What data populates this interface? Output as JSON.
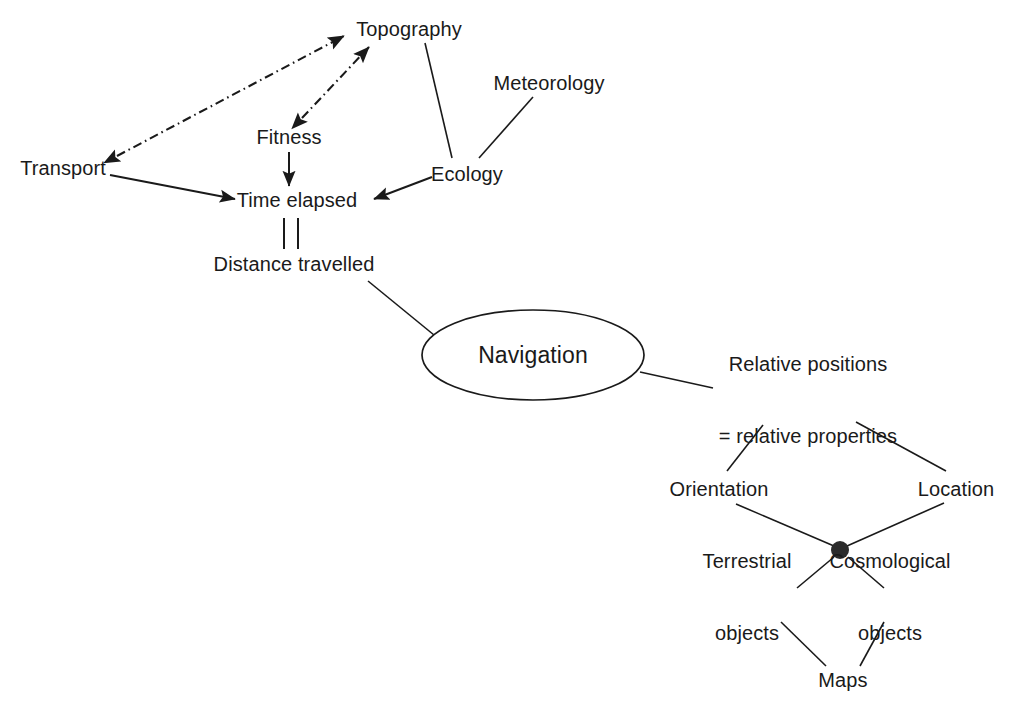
{
  "diagram": {
    "background_color": "#ffffff",
    "stroke_color": "#1a1a1a",
    "nodes": {
      "topography": {
        "label": "Topography",
        "x": 409,
        "y": 29
      },
      "meteorology": {
        "label": "Meteorology",
        "x": 549,
        "y": 83
      },
      "fitness": {
        "label": "Fitness",
        "x": 289,
        "y": 137
      },
      "ecology": {
        "label": "Ecology",
        "x": 467,
        "y": 174
      },
      "transport": {
        "label": "Transport",
        "x": 63,
        "y": 168
      },
      "time_elapsed": {
        "label": "Time elapsed",
        "x": 297,
        "y": 200
      },
      "distance_travelled": {
        "label": "Distance travelled",
        "x": 294,
        "y": 264
      },
      "navigation": {
        "label": "Navigation",
        "x": 533,
        "y": 355
      },
      "relative_positions": {
        "label_line1": "Relative positions",
        "label_line2": "= relative properties",
        "x": 808,
        "y": 400
      },
      "orientation": {
        "label": "Orientation",
        "x": 719,
        "y": 489
      },
      "location": {
        "label": "Location",
        "x": 956,
        "y": 489
      },
      "junction": {
        "label": "junction-dot",
        "x": 840,
        "y": 550,
        "radius": 9
      },
      "terrestrial_objects": {
        "label_line1": "Terrestrial",
        "label_line2": "objects",
        "x": 747,
        "y": 597
      },
      "cosmological_objects": {
        "label_line1": "Cosmological",
        "label_line2": "objects",
        "x": 890,
        "y": 597
      },
      "maps": {
        "label": "Maps",
        "x": 843,
        "y": 680
      }
    },
    "edges": [
      {
        "name": "transport-topography",
        "style": "dash-dot",
        "arrows": "both",
        "from": "transport",
        "to": "topography"
      },
      {
        "name": "fitness-topography",
        "style": "dash-dot",
        "arrows": "both",
        "from": "fitness",
        "to": "topography"
      },
      {
        "name": "topography-ecology",
        "style": "solid",
        "arrows": "none",
        "from": "topography",
        "to": "ecology"
      },
      {
        "name": "meteorology-ecology",
        "style": "solid",
        "arrows": "none",
        "from": "meteorology",
        "to": "ecology"
      },
      {
        "name": "transport-time-elapsed",
        "style": "solid",
        "arrows": "end",
        "from": "transport",
        "to": "time_elapsed"
      },
      {
        "name": "fitness-time-elapsed",
        "style": "solid",
        "arrows": "end",
        "from": "fitness",
        "to": "time_elapsed"
      },
      {
        "name": "ecology-time-elapsed",
        "style": "solid",
        "arrows": "end",
        "from": "ecology",
        "to": "time_elapsed"
      },
      {
        "name": "time-elapsed-distance-travelled",
        "style": "double-bar",
        "arrows": "none",
        "from": "time_elapsed",
        "to": "distance_travelled"
      },
      {
        "name": "distance-travelled-navigation",
        "style": "solid",
        "arrows": "none",
        "from": "distance_travelled",
        "to": "navigation"
      },
      {
        "name": "navigation-relative-positions",
        "style": "solid",
        "arrows": "none",
        "from": "navigation",
        "to": "relative_positions"
      },
      {
        "name": "relative-positions-orientation",
        "style": "solid",
        "arrows": "none",
        "from": "relative_positions",
        "to": "orientation"
      },
      {
        "name": "relative-positions-location",
        "style": "solid",
        "arrows": "none",
        "from": "relative_positions",
        "to": "location"
      },
      {
        "name": "orientation-junction",
        "style": "solid",
        "arrows": "none",
        "from": "orientation",
        "to": "junction"
      },
      {
        "name": "location-junction",
        "style": "solid",
        "arrows": "none",
        "from": "location",
        "to": "junction"
      },
      {
        "name": "junction-terrestrial-objects",
        "style": "solid",
        "arrows": "none",
        "from": "junction",
        "to": "terrestrial_objects"
      },
      {
        "name": "junction-cosmological-objects",
        "style": "solid",
        "arrows": "none",
        "from": "junction",
        "to": "cosmological_objects"
      },
      {
        "name": "terrestrial-objects-maps",
        "style": "solid",
        "arrows": "none",
        "from": "terrestrial_objects",
        "to": "maps"
      },
      {
        "name": "cosmological-objects-maps",
        "style": "solid",
        "arrows": "none",
        "from": "cosmological_objects",
        "to": "maps"
      }
    ]
  }
}
